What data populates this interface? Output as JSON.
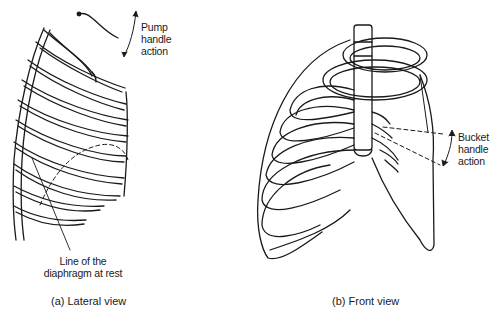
{
  "figure": {
    "panels": [
      {
        "id": "a",
        "caption": "(a)  Lateral view",
        "annotations": {
          "pump": [
            "Pump",
            "handle",
            "action"
          ],
          "diaphragm": [
            "Line of the",
            "diaphragm at rest"
          ]
        }
      },
      {
        "id": "b",
        "caption": "(b)  Front view",
        "annotations": {
          "bucket": [
            "Bucket",
            "handle",
            "action"
          ]
        }
      }
    ],
    "colors": {
      "ink": "#1a1a1a",
      "background": "#ffffff"
    }
  }
}
